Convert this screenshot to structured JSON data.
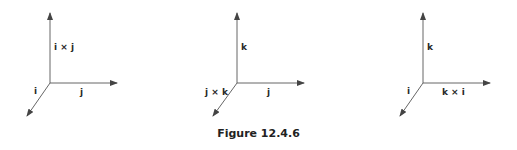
{
  "figure": {
    "caption": "Figure 12.4.6",
    "panels": [
      {
        "origin": [
          50,
          83
        ],
        "labels": {
          "up": "i × j",
          "diag": "i",
          "right": "j"
        }
      },
      {
        "origin": [
          237,
          83
        ],
        "labels": {
          "up": "k",
          "diag": "j × k",
          "right": "j"
        }
      },
      {
        "origin": [
          423,
          83
        ],
        "labels": {
          "up": "k",
          "diag": "i",
          "right": "k × i"
        }
      }
    ]
  },
  "colors": {
    "line": "#555555",
    "text": "#2a2a2a",
    "background": "#ffffff"
  }
}
